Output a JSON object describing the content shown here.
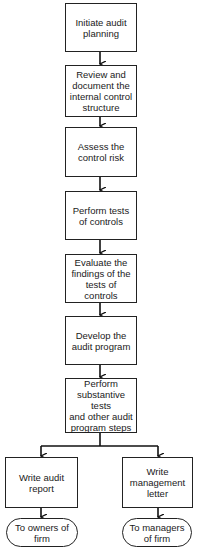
{
  "diagram": {
    "type": "flowchart",
    "steps": [
      {
        "id": "s1",
        "label": "Initiate audit\nplanning"
      },
      {
        "id": "s2",
        "label": "Review and\ndocument the\ninternal control\nstructure"
      },
      {
        "id": "s3",
        "label": "Assess the\ncontrol risk"
      },
      {
        "id": "s4",
        "label": "Perform tests\nof controls"
      },
      {
        "id": "s5",
        "label": "Evaluate the\nfindings of the\ntests of controls"
      },
      {
        "id": "s6",
        "label": "Develop the\naudit program"
      },
      {
        "id": "s7",
        "label": "Perform\nsubstantive tests\nand other audit\nprogram steps"
      }
    ],
    "branches": [
      {
        "id": "b1",
        "label": "Write audit\nreport",
        "terminal": "To owners of\nfirm"
      },
      {
        "id": "b2",
        "label": "Write\nmanagement\nletter",
        "terminal": "To managers\nof firm"
      }
    ],
    "edges": [
      [
        "s1",
        "s2"
      ],
      [
        "s2",
        "s3"
      ],
      [
        "s3",
        "s4"
      ],
      [
        "s4",
        "s5"
      ],
      [
        "s5",
        "s6"
      ],
      [
        "s6",
        "s7"
      ],
      [
        "s7",
        "b1"
      ],
      [
        "s7",
        "b2"
      ],
      [
        "b1",
        "t1"
      ],
      [
        "b2",
        "t2"
      ]
    ]
  }
}
